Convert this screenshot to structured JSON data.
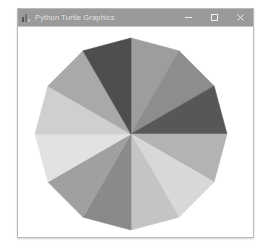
{
  "window": {
    "title": "Python Turtle Graphics",
    "icon": "python-turtle-icon",
    "controls": {
      "minimize_label": "—",
      "maximize_label": "□",
      "close_label": "✕"
    },
    "titlebar_color": "#9a9a9a",
    "canvas_background": "#ffffff"
  },
  "chart_data": {
    "type": "pie",
    "title": "",
    "subtitle": "",
    "xlabel": "",
    "ylabel": "",
    "legend": [],
    "grid": false,
    "shape": "dodecagon",
    "sides": 12,
    "center": {
      "x": 131,
      "y": 133
    },
    "radius": 96,
    "start_angle_deg": -90,
    "wedge_angle_deg": 30,
    "categories": [
      "wedge-1",
      "wedge-2",
      "wedge-3",
      "wedge-4",
      "wedge-5",
      "wedge-6",
      "wedge-7",
      "wedge-8",
      "wedge-9",
      "wedge-10",
      "wedge-11",
      "wedge-12"
    ],
    "values": [
      30,
      30,
      30,
      30,
      30,
      30,
      30,
      30,
      30,
      30,
      30,
      30
    ],
    "colors": [
      "#9d9d9d",
      "#8d8d8d",
      "#575757",
      "#b3b3b3",
      "#d8d8d8",
      "#c4c4c4",
      "#8a8a8a",
      "#a0a0a0",
      "#e2e2e2",
      "#cfcfcf",
      "#a9a9a9",
      "#4e4e4e"
    ],
    "outline_color": "#9a9a9a"
  }
}
